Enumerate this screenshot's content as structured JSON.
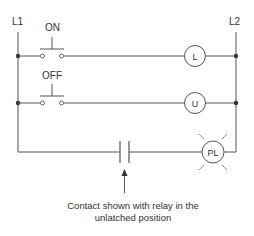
{
  "rails": {
    "left_label": "L1",
    "right_label": "L2"
  },
  "rungs": [
    {
      "input_type": "pushbutton-normally-open",
      "input_label": "ON",
      "output_type": "coil",
      "output_label": "L"
    },
    {
      "input_type": "pushbutton-normally-open",
      "input_label": "OFF",
      "output_type": "coil",
      "output_label": "U"
    },
    {
      "input_type": "relay-contact-normally-open",
      "input_label": "",
      "output_type": "pilot-light",
      "output_label": "PL"
    }
  ],
  "annotation": {
    "line1": "Contact shown with relay in the",
    "line2": "unlatched position"
  },
  "colors": {
    "line": "#555555",
    "text": "#333333",
    "background": "#ffffff"
  }
}
